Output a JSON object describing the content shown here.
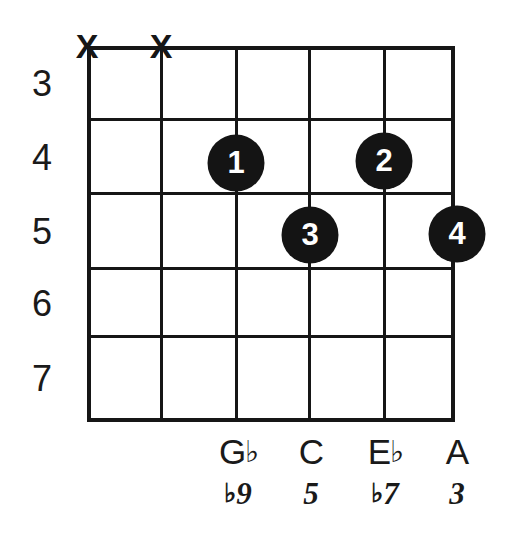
{
  "diagram": {
    "type": "guitar-chord-diagram",
    "instrument": "guitar",
    "strings": 6,
    "frets_shown": 5,
    "ink_color": "#161616",
    "dot_color": "#141414",
    "dot_text_color": "#ffffff",
    "background_color": "#ffffff"
  },
  "fret_numbers": [
    {
      "label": "3"
    },
    {
      "label": "4"
    },
    {
      "label": "5"
    },
    {
      "label": "6"
    },
    {
      "label": "7"
    }
  ],
  "mute_markers": [
    {
      "string": 1,
      "symbol": "X"
    },
    {
      "string": 2,
      "symbol": "X"
    }
  ],
  "finger_dots": [
    {
      "finger": "1",
      "string": 3,
      "fret": 4
    },
    {
      "finger": "2",
      "string": 5,
      "fret": 4
    },
    {
      "finger": "3",
      "string": 4,
      "fret": 5
    },
    {
      "finger": "4",
      "string": 6,
      "fret": 5
    }
  ],
  "note_labels": [
    {
      "string": 3,
      "letter": "G",
      "accidental": "♭",
      "full": "G♭"
    },
    {
      "string": 4,
      "letter": "C",
      "accidental": "",
      "full": "C"
    },
    {
      "string": 5,
      "letter": "E",
      "accidental": "♭",
      "full": "E♭"
    },
    {
      "string": 6,
      "letter": "A",
      "accidental": "",
      "full": "A"
    }
  ],
  "interval_labels": [
    {
      "string": 3,
      "accidental": "♭",
      "degree": "9",
      "full": "♭9"
    },
    {
      "string": 4,
      "accidental": "",
      "degree": "5",
      "full": "5"
    },
    {
      "string": 5,
      "accidental": "♭",
      "degree": "7",
      "full": "♭7"
    },
    {
      "string": 6,
      "accidental": "",
      "degree": "3",
      "full": "3"
    }
  ]
}
